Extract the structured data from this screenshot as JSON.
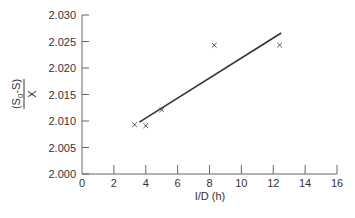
{
  "chart_data": {
    "type": "scatter",
    "title": "",
    "xlabel": "I/D (h)",
    "ylabel": "(S0-S)/X",
    "ylabel_parts": {
      "numerator": "(S",
      "subscript": "0",
      "numerator_rest": "-S)",
      "denominator": "X"
    },
    "xlim": [
      0,
      16
    ],
    "ylim": [
      2.0,
      2.03
    ],
    "x_ticks": [
      "0",
      "2",
      "4",
      "6",
      "8",
      "10",
      "12",
      "14",
      "16"
    ],
    "y_ticks": [
      "2.000",
      "2.005",
      "2.010",
      "2.015",
      "2.020",
      "2.025",
      "2.030"
    ],
    "grid": false,
    "legend": null,
    "series": [
      {
        "name": "data",
        "marker": "x",
        "points": [
          {
            "x": 3.3,
            "y": 2.0093
          },
          {
            "x": 4.0,
            "y": 2.0091
          },
          {
            "x": 5.0,
            "y": 2.0121
          },
          {
            "x": 8.3,
            "y": 2.0243
          },
          {
            "x": 12.4,
            "y": 2.0243
          }
        ]
      },
      {
        "name": "fit",
        "type": "line",
        "points": [
          {
            "x": 3.6,
            "y": 2.0098
          },
          {
            "x": 12.5,
            "y": 2.0266
          }
        ]
      }
    ]
  },
  "colors": {
    "axis": "#666666",
    "text": "#333333",
    "line": "#333333",
    "marker": "#444444"
  }
}
